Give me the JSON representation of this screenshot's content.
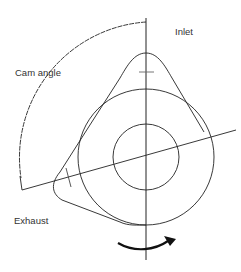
{
  "labels": {
    "inlet": "Inlet",
    "cam_angle": "Cam angle",
    "exhaust": "Exhaust"
  },
  "colors": {
    "line": "#222222",
    "text": "#333333",
    "background": "#ffffff"
  },
  "rotation_direction": "clockwise-arrow"
}
